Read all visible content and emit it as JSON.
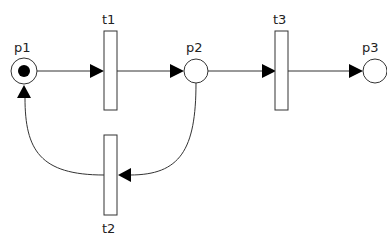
{
  "diagram": {
    "type": "petri-net",
    "places": [
      {
        "id": "p1",
        "label": "p1",
        "tokens": 1
      },
      {
        "id": "p2",
        "label": "p2",
        "tokens": 0
      },
      {
        "id": "p3",
        "label": "p3",
        "tokens": 0
      }
    ],
    "transitions": [
      {
        "id": "t1",
        "label": "t1"
      },
      {
        "id": "t2",
        "label": "t2"
      },
      {
        "id": "t3",
        "label": "t3"
      }
    ],
    "arcs": [
      {
        "from": "p1",
        "to": "t1"
      },
      {
        "from": "t1",
        "to": "p2"
      },
      {
        "from": "p2",
        "to": "t3"
      },
      {
        "from": "t3",
        "to": "p3"
      },
      {
        "from": "p2",
        "to": "t2"
      },
      {
        "from": "t2",
        "to": "p1"
      }
    ]
  }
}
